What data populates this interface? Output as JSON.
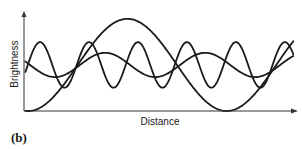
{
  "chart_data": {
    "type": "line",
    "title": "",
    "panel_label": "(b)",
    "xlabel": "Distance",
    "ylabel": "Brightness",
    "xlim": [
      0,
      10
    ],
    "ylim": [
      0,
      1
    ],
    "grid": false,
    "legend": "none",
    "x_ticks": [],
    "y_ticks": [],
    "curve_domain": [
      0.05,
      9.9
    ],
    "series": [
      {
        "name": "long-wavelength",
        "form": "sinusoid",
        "mean": 0.475,
        "amplitude": -0.475,
        "period": 7.3,
        "phase_x": 0.15,
        "color": "#1a1a1a"
      },
      {
        "name": "medium-wavelength",
        "form": "sinusoid",
        "mean": 0.475,
        "amplitude": -0.125,
        "period": 3.68,
        "phase_x": 1.14,
        "color": "#1a1a1a"
      },
      {
        "name": "short-wavelength",
        "form": "sinusoid",
        "mean": 0.475,
        "amplitude": 0.235,
        "period": 1.8,
        "phase_x": 0.59,
        "color": "#1a1a1a"
      }
    ]
  }
}
